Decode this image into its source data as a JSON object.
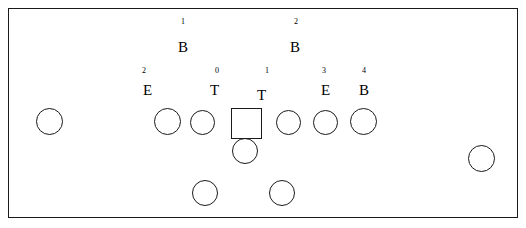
{
  "diagram": {
    "background_color": "#ffffff",
    "stroke_color": "#1a1a1a",
    "frame": {
      "x": 8,
      "y": 8,
      "width": 510,
      "height": 210
    },
    "position_labels": [
      {
        "id": "backer-left",
        "letter": "B",
        "number": "1",
        "letter_x": 178,
        "letter_y": 40,
        "number_x": 181,
        "number_y": 18
      },
      {
        "id": "backer-right",
        "letter": "B",
        "number": "2",
        "letter_x": 290,
        "letter_y": 40,
        "number_x": 294,
        "number_y": 18
      },
      {
        "id": "end-left",
        "letter": "E",
        "number": "2",
        "letter_x": 143,
        "letter_y": 83,
        "number_x": 142,
        "number_y": 67
      },
      {
        "id": "tackle-left",
        "letter": "T",
        "number": "0",
        "letter_x": 210,
        "letter_y": 83,
        "number_x": 215,
        "number_y": 67
      },
      {
        "id": "tackle-right",
        "letter": "T",
        "number": "1",
        "letter_x": 257,
        "letter_y": 88,
        "number_x": 265,
        "number_y": 67
      },
      {
        "id": "end-right",
        "letter": "E",
        "number": "3",
        "letter_x": 321,
        "letter_y": 83,
        "number_x": 322,
        "number_y": 67
      },
      {
        "id": "backer-outside",
        "letter": "B",
        "number": "4",
        "letter_x": 359,
        "letter_y": 83,
        "number_x": 362,
        "number_y": 67
      }
    ],
    "players": [
      {
        "id": "player-wide-left",
        "shape": "circle",
        "x": 36,
        "y": 108,
        "size": 27
      },
      {
        "id": "player-line-1",
        "shape": "circle",
        "x": 154,
        "y": 108,
        "size": 27
      },
      {
        "id": "player-line-2",
        "shape": "circle",
        "x": 190,
        "y": 110,
        "size": 25
      },
      {
        "id": "player-center-ball",
        "shape": "square",
        "x": 231,
        "y": 108,
        "size": 31
      },
      {
        "id": "player-line-3",
        "shape": "circle",
        "x": 276,
        "y": 110,
        "size": 25
      },
      {
        "id": "player-line-4",
        "shape": "circle",
        "x": 313,
        "y": 110,
        "size": 25
      },
      {
        "id": "player-line-5",
        "shape": "circle",
        "x": 350,
        "y": 108,
        "size": 27
      },
      {
        "id": "player-wide-right",
        "shape": "circle",
        "x": 468,
        "y": 145,
        "size": 27
      },
      {
        "id": "player-quarterback",
        "shape": "circle",
        "x": 232,
        "y": 138,
        "size": 26
      },
      {
        "id": "player-back-left",
        "shape": "circle",
        "x": 192,
        "y": 180,
        "size": 26
      },
      {
        "id": "player-back-right",
        "shape": "circle",
        "x": 269,
        "y": 180,
        "size": 26
      }
    ]
  },
  "chart_data": {
    "type": "scatter",
    "xlabel": "",
    "ylabel": "",
    "xlim": [
      8,
      518
    ],
    "ylim": [
      8,
      218
    ],
    "grid": false,
    "legend": "none",
    "annotations": [
      "1 B",
      "2 B",
      "2 E",
      "0 T",
      "1 T",
      "3 E",
      "4 B"
    ],
    "series": [
      {
        "name": "Offensive players (circles)",
        "marker": "circle",
        "x": [
          49,
          167,
          202,
          288,
          325,
          363,
          481,
          245,
          205,
          282
        ],
        "y": [
          121,
          121,
          122,
          122,
          122,
          121,
          158,
          151,
          193,
          193
        ]
      },
      {
        "name": "Center / ball (square)",
        "marker": "square",
        "x": [
          246
        ],
        "y": [
          123
        ]
      }
    ],
    "labels": [
      {
        "text": "B",
        "number": "1",
        "x": 183,
        "y": 47
      },
      {
        "text": "B",
        "number": "2",
        "x": 296,
        "y": 47
      },
      {
        "text": "E",
        "number": "2",
        "x": 148,
        "y": 90
      },
      {
        "text": "T",
        "number": "0",
        "x": 216,
        "y": 90
      },
      {
        "text": "T",
        "number": "1",
        "x": 263,
        "y": 95
      },
      {
        "text": "E",
        "number": "3",
        "x": 326,
        "y": 90
      },
      {
        "text": "B",
        "number": "4",
        "x": 365,
        "y": 90
      }
    ]
  }
}
